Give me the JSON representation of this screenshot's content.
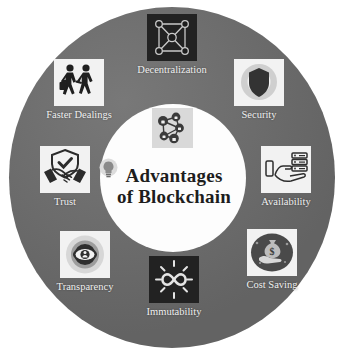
{
  "diagram": {
    "type": "circular-infographic",
    "center": {
      "title_line1": "Advantages",
      "title_line2": "of Blockchain",
      "center_icon": "blockchain-network-lock-icon",
      "side_icon": "lightbulb-icon"
    },
    "colors": {
      "ring": "#6e6e6e",
      "hub": "#fdfdfd",
      "label_text": "#f0f0f0",
      "title_text": "#1d1d1d",
      "tile_light": "#f2f2f2",
      "tile_dark": "#222222"
    },
    "nodes": [
      {
        "id": "decentralization",
        "label": "Decentralization",
        "icon": "network-mesh-icon",
        "tile": "dark"
      },
      {
        "id": "security",
        "label": "Security",
        "icon": "shield-icon",
        "tile": "light"
      },
      {
        "id": "availability",
        "label": "Availability",
        "icon": "hand-server-icon",
        "tile": "light"
      },
      {
        "id": "cost-saving",
        "label": "Cost Saving",
        "icon": "hand-money-bag-icon",
        "tile": "light"
      },
      {
        "id": "immutability",
        "label": "Immutability",
        "icon": "infinity-rays-icon",
        "tile": "dark"
      },
      {
        "id": "transparency",
        "label": "Transparency",
        "icon": "eye-icon",
        "tile": "light"
      },
      {
        "id": "trust",
        "label": "Trust",
        "icon": "shield-handshake-icon",
        "tile": "light"
      },
      {
        "id": "faster-dealings",
        "label": "Faster Dealings",
        "icon": "two-people-walking-icon",
        "tile": "light"
      }
    ]
  }
}
